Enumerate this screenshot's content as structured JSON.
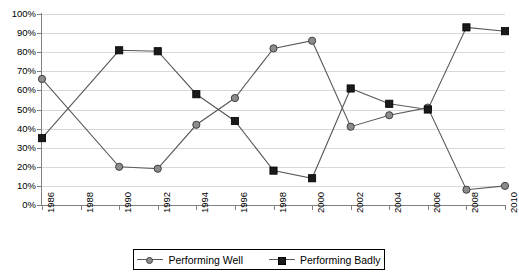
{
  "chart_data": {
    "type": "line",
    "title": "",
    "xlabel": "",
    "ylabel": "",
    "x": [
      1986,
      1988,
      1990,
      1992,
      1994,
      1996,
      1998,
      2000,
      2002,
      2004,
      2006,
      2008,
      2010
    ],
    "xtick_labels": [
      "1986",
      "1988",
      "1990",
      "1992",
      "1994",
      "1996",
      "1998",
      "2000",
      "2002",
      "2004",
      "2006",
      "2008",
      "2010"
    ],
    "ytick_labels": [
      "0%",
      "10%",
      "20%",
      "30%",
      "40%",
      "50%",
      "60%",
      "70%",
      "80%",
      "90%",
      "100%"
    ],
    "ytick_values": [
      0,
      10,
      20,
      30,
      40,
      50,
      60,
      70,
      80,
      90,
      100
    ],
    "ylim": [
      0,
      100
    ],
    "grid": true,
    "legend_position": "bottom",
    "series": [
      {
        "name": "Performing Well",
        "marker": "circle",
        "color": "#8c8c8c",
        "line_color": "#595959",
        "values": [
          66,
          null,
          20,
          19,
          42,
          56,
          82,
          86,
          41,
          47,
          51,
          8,
          10
        ]
      },
      {
        "name": "Performing Badly",
        "marker": "square",
        "color": "#1a1a1a",
        "line_color": "#595959",
        "values": [
          35,
          null,
          81,
          80.5,
          58,
          44,
          18,
          14,
          61,
          53,
          50,
          93,
          91
        ]
      }
    ]
  },
  "legend": {
    "entries": [
      {
        "label": "Performing Well",
        "marker": "circle-marker"
      },
      {
        "label": "Performing Badly",
        "marker": "square-marker"
      }
    ]
  },
  "colors": {
    "grid": "#d9d9d9",
    "axis": "#808080",
    "line": "#595959",
    "series_well": "#8c8c8c",
    "series_badly": "#1a1a1a",
    "background": "#ffffff"
  }
}
